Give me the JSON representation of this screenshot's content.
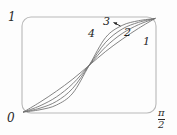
{
  "figure": {
    "name": "sigmoid-curve-family-plot",
    "background_color": "#fdfdfd",
    "frame_color": "#b9b9b9",
    "curve_color": "#6e6e6e"
  },
  "axes": {
    "y_max_label": "1",
    "origin_label": "0",
    "x_max_numerator": "π",
    "x_max_denominator": "2"
  },
  "curve_labels": [
    {
      "text": "1"
    },
    {
      "text": "2"
    },
    {
      "text": "3"
    },
    {
      "text": "4"
    }
  ],
  "chart_data": {
    "type": "line",
    "title": "",
    "xlabel": "",
    "ylabel": "",
    "xlim": [
      0,
      1.5708
    ],
    "ylim": [
      0,
      1
    ],
    "x_tick_labels": [
      "0",
      "π/2"
    ],
    "y_tick_labels": [
      "0",
      "1"
    ],
    "grid": false,
    "legend": "inline curve numbers 1-4 near upper-right of each curve",
    "annotations": [
      {
        "text": "3",
        "note": "arrow points from label 3 toward the steepest-shoulder curve"
      }
    ],
    "x": [
      0.0,
      0.19635,
      0.3927,
      0.58905,
      0.7854,
      0.98175,
      1.1781,
      1.37445,
      1.5708
    ],
    "series": [
      {
        "name": "1",
        "label": "1",
        "values": [
          0.0,
          0.105,
          0.222,
          0.352,
          0.5,
          0.648,
          0.778,
          0.895,
          1.0
        ]
      },
      {
        "name": "2",
        "label": "2",
        "values": [
          0.0,
          0.066,
          0.161,
          0.303,
          0.5,
          0.697,
          0.839,
          0.934,
          1.0
        ]
      },
      {
        "name": "3",
        "label": "3",
        "values": [
          0.0,
          0.041,
          0.113,
          0.254,
          0.5,
          0.746,
          0.887,
          0.959,
          1.0
        ]
      },
      {
        "name": "4",
        "label": "4",
        "values": [
          0.0,
          0.024,
          0.074,
          0.202,
          0.5,
          0.798,
          0.926,
          0.976,
          1.0
        ]
      }
    ]
  }
}
